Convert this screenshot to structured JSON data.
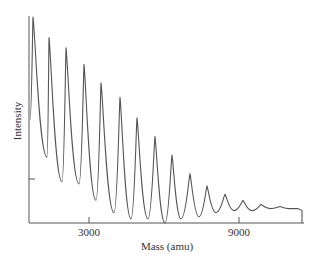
{
  "chart_data": {
    "type": "line",
    "title": "",
    "xlabel": "Mass (amu)",
    "ylabel": "Intensity",
    "xlim": [
      600,
      11550
    ],
    "ylim": [
      0,
      100
    ],
    "xticks": [
      3000,
      9000
    ],
    "xtick_labels": [
      "3000",
      "9000"
    ],
    "yticks": [
      21
    ],
    "ytick_labels": [
      ""
    ],
    "grid": false,
    "legend": null,
    "line_color": "#555555",
    "peaks": {
      "x": [
        760,
        1400,
        2080,
        2800,
        3480,
        4240,
        4920,
        5640,
        6320,
        7040,
        7720,
        8440,
        9160,
        9880,
        10640,
        11320
      ],
      "y": [
        100,
        90,
        85,
        77,
        68,
        61,
        51,
        42,
        33,
        24,
        18,
        14,
        11,
        9,
        8,
        7
      ]
    },
    "valleys": {
      "x": [
        1320,
        1920,
        2600,
        3280,
        4000,
        4680,
        5360,
        6040,
        6680,
        7400,
        8080,
        8800,
        9520,
        10240,
        11000
      ],
      "y": [
        32,
        20,
        19,
        11,
        5,
        2,
        2,
        0,
        2,
        3,
        5,
        6,
        6,
        7,
        7
      ]
    },
    "start_point": {
      "x": 640,
      "y": 50
    },
    "end_point": {
      "x": 11520,
      "y": 6
    }
  },
  "axes": {
    "x_title": "Mass (amu)",
    "y_title": "Intensity",
    "x_tick_labels": [
      "3000",
      "9000"
    ]
  }
}
